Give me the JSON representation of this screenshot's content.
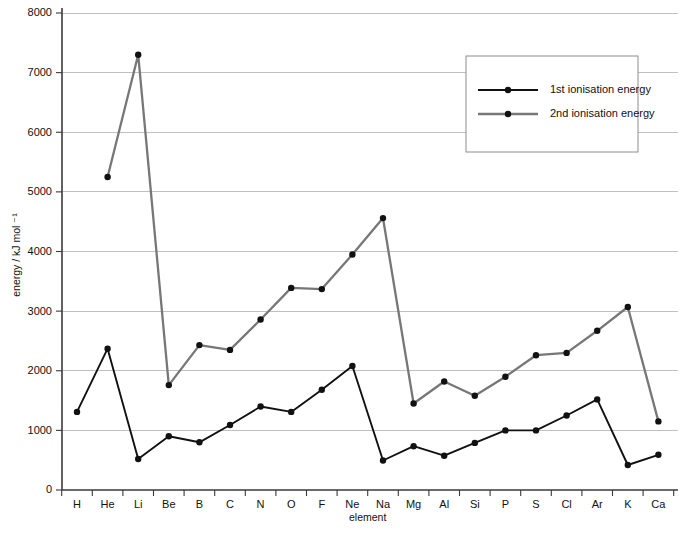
{
  "chart_data": {
    "type": "line",
    "title": "",
    "xlabel": "element",
    "ylabel": "energy / kJ mol⁻¹",
    "categories": [
      "H",
      "He",
      "Li",
      "Be",
      "B",
      "C",
      "N",
      "O",
      "F",
      "Ne",
      "Na",
      "Mg",
      "Al",
      "Si",
      "P",
      "S",
      "Cl",
      "Ar",
      "K",
      "Ca"
    ],
    "ylim": [
      0,
      8000
    ],
    "yticks": [
      0,
      1000,
      2000,
      3000,
      4000,
      5000,
      6000,
      7000,
      8000
    ],
    "ytick_labels": [
      "0",
      "1000",
      "2000",
      "3000",
      "4000",
      "5000",
      "6000",
      "7000",
      "8000"
    ],
    "grid": "horizontal",
    "legend_position": "top-right",
    "series": [
      {
        "name": "1st ionisation energy",
        "color": "#111111",
        "values": [
          1310,
          2370,
          520,
          900,
          800,
          1090,
          1400,
          1310,
          1680,
          2080,
          495,
          735,
          575,
          790,
          1000,
          1000,
          1250,
          1520,
          420,
          590
        ]
      },
      {
        "name": "2nd ionisation energy",
        "color": "#777777",
        "values": [
          null,
          5250,
          7300,
          1760,
          2430,
          2350,
          2860,
          3390,
          3370,
          3950,
          4560,
          1450,
          1820,
          1580,
          1900,
          2260,
          2300,
          2670,
          3070,
          1150
        ]
      }
    ]
  },
  "legend": {
    "items": [
      {
        "label": "1st ionisation energy",
        "color": "#111111"
      },
      {
        "label": "2nd ionisation energy",
        "color": "#777777"
      }
    ]
  },
  "axes": {
    "y_title": "energy / kJ mol ⁻¹",
    "x_title": "element"
  }
}
